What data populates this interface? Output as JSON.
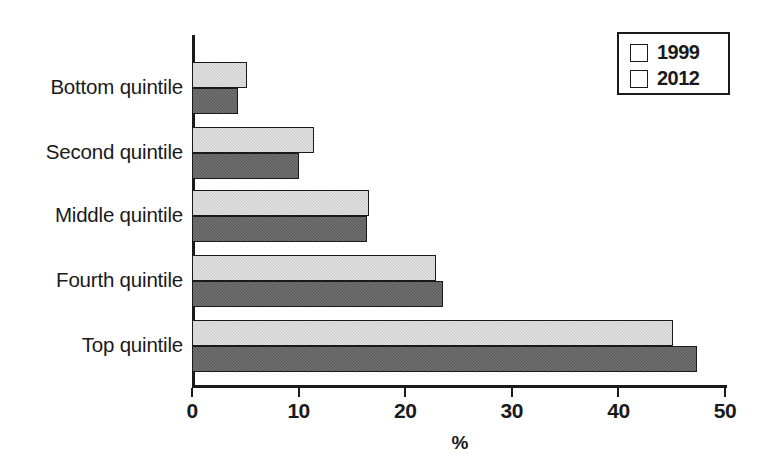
{
  "chart_data": {
    "type": "bar",
    "orientation": "horizontal",
    "title": "",
    "xlabel": "%",
    "ylabel": "",
    "xlim": [
      0,
      50
    ],
    "xticks": [
      0,
      10,
      20,
      30,
      40,
      50
    ],
    "xtick_labels": [
      "0",
      "10",
      "20",
      "30",
      "40",
      "50"
    ],
    "grid": false,
    "legend_position": "top-right",
    "categories": [
      "Bottom quintile",
      "Second quintile",
      "Middle quintile",
      "Fourth quintile",
      "Top quintile"
    ],
    "series": [
      {
        "name": "1999",
        "color": "#c9c9c9",
        "values": [
          5.2,
          11.4,
          16.6,
          22.9,
          45.1
        ]
      },
      {
        "name": "2012",
        "color": "#565656",
        "values": [
          4.3,
          10.0,
          16.4,
          23.5,
          47.4
        ]
      }
    ]
  },
  "legend": {
    "entries": [
      {
        "label": "1999",
        "swatch": "light-gray-swatch"
      },
      {
        "label": "2012",
        "swatch": "dark-gray-swatch"
      }
    ]
  },
  "axis": {
    "x_title": "%"
  }
}
